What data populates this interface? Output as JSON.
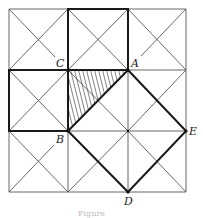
{
  "figure": {
    "caption": "Figure",
    "grid": {
      "x_lines": [
        9,
        68,
        128,
        186
      ],
      "y_lines": [
        9,
        70,
        131,
        192
      ]
    },
    "points": {
      "A": {
        "label": "A",
        "x": 128,
        "y": 70
      },
      "B": {
        "label": "B",
        "x": 68,
        "y": 131
      },
      "C": {
        "label": "C",
        "x": 68,
        "y": 70
      },
      "D": {
        "label": "D",
        "x": 128,
        "y": 192
      },
      "E": {
        "label": "E",
        "x": 186,
        "y": 131
      }
    },
    "bold_shapes": [
      {
        "name": "top-middle-square",
        "vertices": [
          "(68,9)",
          "(128,9)",
          "A",
          "C"
        ]
      },
      {
        "name": "left-middle-square",
        "vertices": [
          "(9,70)",
          "C",
          "B",
          "(9,131)"
        ]
      },
      {
        "name": "tilted-square",
        "vertices": [
          "A",
          "E",
          "D",
          "B"
        ]
      }
    ],
    "hatched_region": {
      "name": "triangle-CAB",
      "vertices": [
        "C",
        "A",
        "B"
      ]
    },
    "colors": {
      "line": "#555555",
      "bold": "#1a1a1a",
      "background": "#ffffff"
    }
  }
}
